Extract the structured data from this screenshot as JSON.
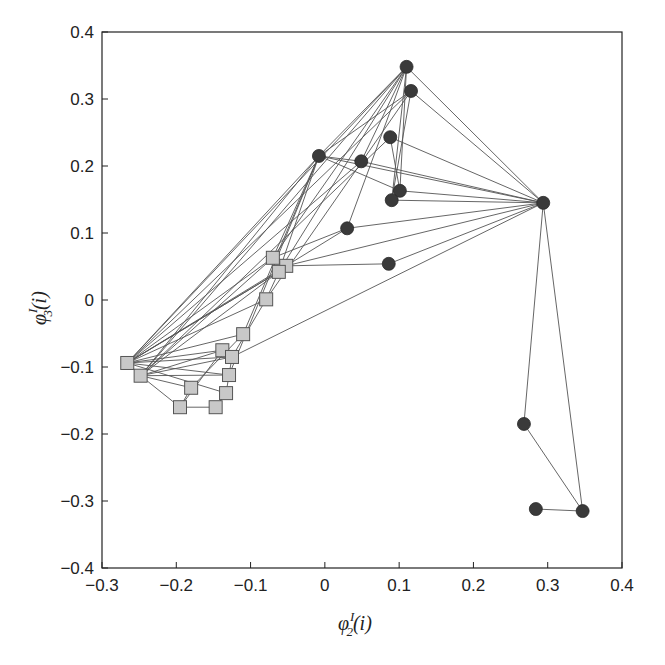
{
  "chart_data": {
    "type": "scatter",
    "subtype": "network-graph",
    "title": "",
    "xlabel": "φ^I_2(i)",
    "ylabel": "φ^I_3(i)",
    "xlabel_parts": {
      "base": "φ",
      "sup": "I",
      "sub": "2",
      "tail": "(i)"
    },
    "ylabel_parts": {
      "base": "φ",
      "sup": "I",
      "sub": "3",
      "tail": "(i)"
    },
    "xlim": [
      -0.3,
      0.4
    ],
    "ylim": [
      -0.4,
      0.4
    ],
    "xticks": [
      -0.3,
      -0.2,
      -0.1,
      0,
      0.1,
      0.2,
      0.3,
      0.4
    ],
    "yticks": [
      -0.4,
      -0.3,
      -0.2,
      -0.1,
      0,
      0.1,
      0.2,
      0.3,
      0.4
    ],
    "xtick_labels": [
      "−0.3",
      "−0.2",
      "−0.1",
      "0",
      "0.1",
      "0.2",
      "0.3",
      "0.4"
    ],
    "ytick_labels": [
      "−0.4",
      "−0.3",
      "−0.2",
      "−0.1",
      "0",
      "0.1",
      "0.2",
      "0.3",
      "0.4"
    ],
    "grid": false,
    "legend": null,
    "colors": {
      "circle_fill": "#3a3a3a",
      "square_fill": "#c8c8c8",
      "square_stroke": "#555555",
      "edge": "#555555",
      "axis": "#222222"
    },
    "series": [
      {
        "name": "circles",
        "marker": "circle",
        "points": [
          {
            "id": "c0",
            "x": 0.11,
            "y": 0.348
          },
          {
            "id": "c1",
            "x": 0.116,
            "y": 0.312
          },
          {
            "id": "c2",
            "x": 0.088,
            "y": 0.243
          },
          {
            "id": "c3",
            "x": -0.008,
            "y": 0.215
          },
          {
            "id": "c4",
            "x": 0.049,
            "y": 0.207
          },
          {
            "id": "c5",
            "x": 0.101,
            "y": 0.163
          },
          {
            "id": "c6",
            "x": 0.09,
            "y": 0.149
          },
          {
            "id": "c7",
            "x": 0.03,
            "y": 0.107
          },
          {
            "id": "c8",
            "x": 0.086,
            "y": 0.054
          },
          {
            "id": "c9",
            "x": 0.294,
            "y": 0.145
          },
          {
            "id": "c10",
            "x": 0.268,
            "y": -0.185
          },
          {
            "id": "c11",
            "x": 0.284,
            "y": -0.312
          },
          {
            "id": "c12",
            "x": 0.347,
            "y": -0.315
          }
        ]
      },
      {
        "name": "squares",
        "marker": "square",
        "points": [
          {
            "id": "s0",
            "x": -0.07,
            "y": 0.063
          },
          {
            "id": "s1",
            "x": -0.052,
            "y": 0.051
          },
          {
            "id": "s2",
            "x": -0.062,
            "y": 0.042
          },
          {
            "id": "s3",
            "x": -0.079,
            "y": 0.001
          },
          {
            "id": "s4",
            "x": -0.11,
            "y": -0.051
          },
          {
            "id": "s5",
            "x": -0.138,
            "y": -0.075
          },
          {
            "id": "s6",
            "x": -0.125,
            "y": -0.085
          },
          {
            "id": "s7",
            "x": -0.266,
            "y": -0.094
          },
          {
            "id": "s8",
            "x": -0.248,
            "y": -0.113
          },
          {
            "id": "s9",
            "x": -0.129,
            "y": -0.112
          },
          {
            "id": "s10",
            "x": -0.18,
            "y": -0.131
          },
          {
            "id": "s11",
            "x": -0.133,
            "y": -0.139
          },
          {
            "id": "s12",
            "x": -0.195,
            "y": -0.16
          },
          {
            "id": "s13",
            "x": -0.147,
            "y": -0.16
          }
        ]
      }
    ],
    "edges": [
      [
        "c9",
        "c0"
      ],
      [
        "c9",
        "c1"
      ],
      [
        "c9",
        "c2"
      ],
      [
        "c9",
        "c3"
      ],
      [
        "c9",
        "c4"
      ],
      [
        "c9",
        "c5"
      ],
      [
        "c9",
        "c6"
      ],
      [
        "c9",
        "c7"
      ],
      [
        "c9",
        "c8"
      ],
      [
        "c9",
        "c10"
      ],
      [
        "c9",
        "c12"
      ],
      [
        "c10",
        "c12"
      ],
      [
        "c11",
        "c12"
      ],
      [
        "c9",
        "s1"
      ],
      [
        "c9",
        "s6"
      ],
      [
        "c0",
        "c3"
      ],
      [
        "c0",
        "c4"
      ],
      [
        "c0",
        "c5"
      ],
      [
        "c0",
        "c6"
      ],
      [
        "c0",
        "c7"
      ],
      [
        "c0",
        "s0"
      ],
      [
        "c0",
        "s2"
      ],
      [
        "c0",
        "s7"
      ],
      [
        "c0",
        "s8"
      ],
      [
        "c1",
        "c3"
      ],
      [
        "c1",
        "c6"
      ],
      [
        "c1",
        "s3"
      ],
      [
        "c1",
        "s7"
      ],
      [
        "c2",
        "c5"
      ],
      [
        "c2",
        "s8"
      ],
      [
        "c3",
        "c4"
      ],
      [
        "c3",
        "c5"
      ],
      [
        "c3",
        "s0"
      ],
      [
        "c3",
        "s2"
      ],
      [
        "c3",
        "s4"
      ],
      [
        "c3",
        "s7"
      ],
      [
        "c3",
        "s8"
      ],
      [
        "c3",
        "s9"
      ],
      [
        "c4",
        "s7"
      ],
      [
        "c7",
        "s0"
      ],
      [
        "c7",
        "s1"
      ],
      [
        "c8",
        "s1"
      ],
      [
        "s0",
        "s7"
      ],
      [
        "s0",
        "s8"
      ],
      [
        "s1",
        "s7"
      ],
      [
        "s2",
        "s7"
      ],
      [
        "s2",
        "s7"
      ],
      [
        "s2",
        "s8"
      ],
      [
        "s2",
        "s3"
      ],
      [
        "s3",
        "s7"
      ],
      [
        "s3",
        "s6"
      ],
      [
        "s4",
        "s7"
      ],
      [
        "s4",
        "s10"
      ],
      [
        "s5",
        "s7"
      ],
      [
        "s5",
        "s8"
      ],
      [
        "s6",
        "s7"
      ],
      [
        "s6",
        "s8"
      ],
      [
        "s6",
        "s9"
      ],
      [
        "s7",
        "s8"
      ],
      [
        "s7",
        "s9"
      ],
      [
        "s7",
        "s11"
      ],
      [
        "s8",
        "s9"
      ],
      [
        "s8",
        "s10"
      ],
      [
        "s8",
        "s12"
      ],
      [
        "s9",
        "s11"
      ],
      [
        "s10",
        "s12"
      ],
      [
        "s11",
        "s13"
      ],
      [
        "s12",
        "s13"
      ],
      [
        "s5",
        "s12"
      ]
    ]
  }
}
